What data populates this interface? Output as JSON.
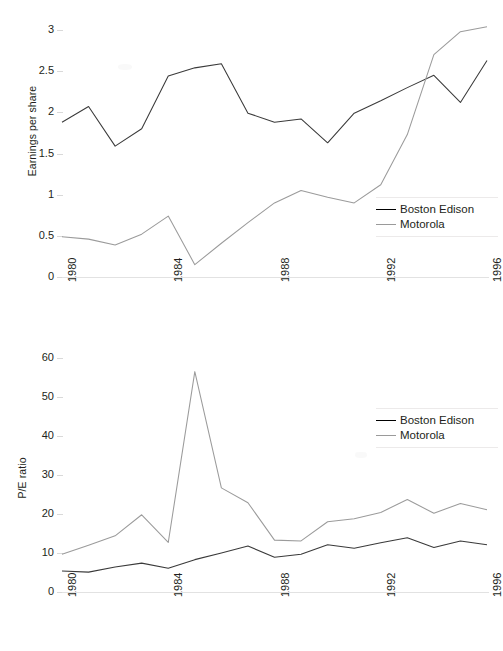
{
  "figure": {
    "background": "#ffffff",
    "series_colors": {
      "boston_edison": "#3a3a3a",
      "motorola": "#9b9b9b"
    }
  },
  "legend": {
    "entries": [
      {
        "label": "Boston Edison",
        "color": "#3a3a3a"
      },
      {
        "label": "Motorola",
        "color": "#9b9b9b"
      }
    ]
  },
  "chart_data": [
    {
      "type": "line",
      "title": "",
      "xlabel": "",
      "ylabel": "Earnings per share",
      "x": [
        1980,
        1981,
        1982,
        1983,
        1984,
        1985,
        1986,
        1987,
        1988,
        1989,
        1990,
        1991,
        1992,
        1993,
        1994,
        1995,
        1996
      ],
      "xticklabels": [
        "1980",
        "1984",
        "1988",
        "1992",
        "1996"
      ],
      "xtickvalues": [
        1980,
        1984,
        1988,
        1992,
        1996
      ],
      "xlim": [
        1980,
        1996
      ],
      "ylim": [
        0,
        3
      ],
      "yticks": [
        0,
        0.5,
        1,
        1.5,
        2,
        2.5,
        3
      ],
      "yticklabels": [
        "0",
        "0.5",
        "1",
        "1.5",
        "2",
        "2.5",
        "3"
      ],
      "grid": false,
      "legend_position": "lower-right",
      "series": [
        {
          "name": "Boston Edison",
          "color": "#3a3a3a",
          "values": [
            1.88,
            2.07,
            1.59,
            1.8,
            2.44,
            2.54,
            2.59,
            1.99,
            1.88,
            1.92,
            1.63,
            1.99,
            2.14,
            2.3,
            2.45,
            2.12,
            2.63
          ]
        },
        {
          "name": "Motorola",
          "color": "#9b9b9b",
          "values": [
            0.49,
            0.46,
            0.39,
            0.52,
            0.74,
            0.15,
            0.41,
            0.66,
            0.9,
            1.05,
            0.97,
            0.9,
            1.12,
            1.73,
            2.7,
            2.98,
            3.04
          ]
        }
      ]
    },
    {
      "type": "line",
      "title": "",
      "xlabel": "",
      "ylabel": "P/E ratio",
      "x": [
        1980,
        1981,
        1982,
        1983,
        1984,
        1985,
        1986,
        1987,
        1988,
        1989,
        1990,
        1991,
        1992,
        1993,
        1994,
        1995,
        1996
      ],
      "xticklabels": [
        "1980",
        "1984",
        "1988",
        "1992",
        "1996"
      ],
      "xtickvalues": [
        1980,
        1984,
        1988,
        1992,
        1996
      ],
      "xlim": [
        1980,
        1996
      ],
      "ylim": [
        0,
        60
      ],
      "yticks": [
        0,
        10,
        20,
        30,
        40,
        50,
        60
      ],
      "yticklabels": [
        "0",
        "10",
        "20",
        "30",
        "40",
        "50",
        "60"
      ],
      "grid": false,
      "legend_position": "upper-right",
      "series": [
        {
          "name": "Boston Edison",
          "color": "#3a3a3a",
          "values": [
            5.4,
            5.1,
            6.4,
            7.4,
            6.1,
            8.3,
            10.0,
            11.8,
            8.9,
            9.7,
            12.1,
            11.2,
            12.6,
            13.9,
            11.4,
            13.1,
            12.1
          ]
        },
        {
          "name": "Motorola",
          "color": "#9b9b9b",
          "values": [
            9.7,
            12.0,
            14.4,
            19.8,
            12.7,
            56.5,
            26.7,
            22.9,
            13.3,
            13.1,
            18.0,
            18.8,
            20.4,
            23.7,
            20.2,
            22.7,
            21.1
          ]
        }
      ]
    }
  ]
}
